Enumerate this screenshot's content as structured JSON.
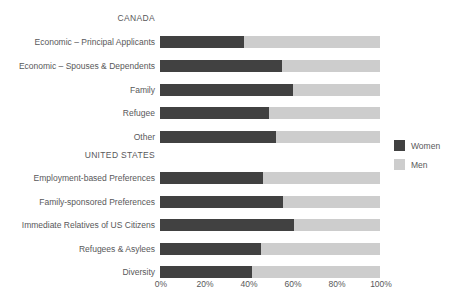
{
  "chart_data": {
    "type": "bar",
    "orientation": "horizontal",
    "stacked": true,
    "normalized": true,
    "title": "",
    "xlabel": "",
    "ylabel": "",
    "xlim": [
      0,
      100
    ],
    "xticks": [
      "0%",
      "20%",
      "40%",
      "60%",
      "80%",
      "100%"
    ],
    "xtick_values": [
      0,
      20,
      40,
      60,
      80,
      100
    ],
    "grid": false,
    "legend_position": "right",
    "series": [
      {
        "name": "Women",
        "color": "#414141",
        "values": [
          38,
          55.5,
          60.5,
          49.5,
          52.7,
          47,
          56,
          61,
          46,
          42
        ]
      },
      {
        "name": "Men",
        "color": "#cdcdcd",
        "values": [
          62,
          44.5,
          39.5,
          50.5,
          47.3,
          53,
          44,
          39,
          54,
          58
        ]
      }
    ],
    "groups": [
      {
        "heading": "CANADA",
        "categories": [
          "Economic – Principal Applicants",
          "Economic – Spouses & Dependents",
          "Family",
          "Refugee",
          "Other"
        ]
      },
      {
        "heading": "UNITED STATES",
        "categories": [
          "Employment-based Preferences",
          "Family-sponsored Preferences",
          "Immediate Relatives of US Citizens",
          "Refugees & Asylees",
          "Diversity"
        ]
      }
    ],
    "categories": [
      "Economic – Principal Applicants",
      "Economic – Spouses & Dependents",
      "Family",
      "Refugee",
      "Other",
      "Employment-based Preferences",
      "Family-sponsored Preferences",
      "Immediate Relatives of US Citizens",
      "Refugees & Asylees",
      "Diversity"
    ]
  },
  "legend": {
    "items": [
      {
        "label": "Women",
        "color": "#414141"
      },
      {
        "label": "Men",
        "color": "#cdcdcd"
      }
    ]
  },
  "layout": {
    "headings": [
      {
        "text": "CANADA",
        "top": 13
      },
      {
        "text": "UNITED STATES",
        "top": 150
      }
    ],
    "rows": [
      {
        "label": "Economic – Principal Applicants",
        "top": 36,
        "women": 38
      },
      {
        "label": "Economic – Spouses & Dependents",
        "top": 60,
        "women": 55.5
      },
      {
        "label": "Family",
        "top": 84,
        "women": 60.5
      },
      {
        "label": "Refugee",
        "top": 107,
        "women": 49.5
      },
      {
        "label": "Other",
        "top": 131,
        "women": 52.7
      },
      {
        "label": "Employment-based Preferences",
        "top": 172,
        "women": 47
      },
      {
        "label": "Family-sponsored Preferences",
        "top": 196,
        "women": 56
      },
      {
        "label": "Immediate Relatives of US Citizens",
        "top": 219,
        "women": 61
      },
      {
        "label": "Refugees & Asylees",
        "top": 243,
        "women": 46
      },
      {
        "label": "Diversity",
        "top": 266,
        "women": 42
      }
    ],
    "ticks": [
      {
        "text": "0%",
        "x": 161
      },
      {
        "text": "20%",
        "x": 205
      },
      {
        "text": "40%",
        "x": 249
      },
      {
        "text": "60%",
        "x": 293
      },
      {
        "text": "80%",
        "x": 337
      },
      {
        "text": "100%",
        "x": 381
      }
    ]
  }
}
